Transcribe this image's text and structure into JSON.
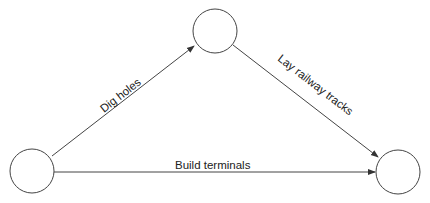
{
  "nodes": [
    {
      "id": "start",
      "cx": 32,
      "cy": 171,
      "r": 22
    },
    {
      "id": "middle",
      "cx": 215,
      "cy": 31,
      "r": 22
    },
    {
      "id": "end",
      "cx": 398,
      "cy": 172,
      "r": 22
    }
  ],
  "edges": [
    {
      "from": "start",
      "to": "middle",
      "label": "Dig holes"
    },
    {
      "from": "middle",
      "to": "end",
      "label": "Lay railway tracks"
    },
    {
      "from": "start",
      "to": "end",
      "label": "Build terminals"
    }
  ],
  "colors": {
    "stroke": "#333333",
    "background": "#ffffff"
  }
}
